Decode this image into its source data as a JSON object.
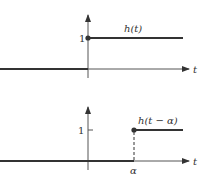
{
  "diagram": {
    "top_plot": {
      "function_label": "h(t)",
      "y_tick_label": "1",
      "x_axis_label": "t",
      "step_at": "0"
    },
    "bottom_plot": {
      "function_label": "h(t − α)",
      "y_tick_label": "1",
      "x_axis_label": "t",
      "step_at_label": "α"
    },
    "colors": {
      "line": "#333333",
      "axis": "#555555",
      "background": "#ffffff"
    }
  }
}
